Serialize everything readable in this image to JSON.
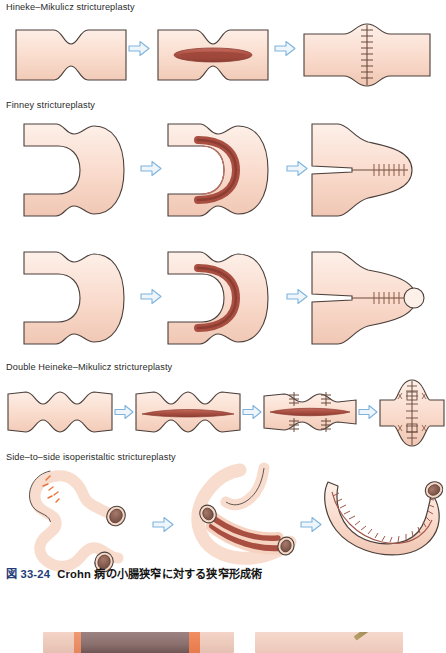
{
  "figure": {
    "number": "図 33-24",
    "caption": "Crohn 病の小腸狭窄に対する狭窄形成術",
    "number_color": "#1f3d7a"
  },
  "sections": [
    {
      "id": "hineke",
      "label": "Hineke–Mikulicz strictureplasty",
      "panel_count": 3
    },
    {
      "id": "finney",
      "label": "Finney strictureplasty",
      "panel_count": 3
    },
    {
      "id": "finney2",
      "label": "",
      "panel_count": 3
    },
    {
      "id": "double-hm",
      "label": "Double Heineke–Mikulicz strictureplasty",
      "panel_count": 4
    },
    {
      "id": "side-to-side",
      "label": "Side–to–side isoperistaltic strictureplasty",
      "panel_count": 3
    }
  ],
  "panels": {
    "hineke": [
      {
        "name": "strictured-bowel-segment",
        "stage": "stricture"
      },
      {
        "name": "longitudinal-enterotomy",
        "stage": "incision"
      },
      {
        "name": "transverse-closure-sutured",
        "stage": "closed"
      }
    ],
    "finney": [
      {
        "name": "folded-bowel-loop",
        "stage": "folded"
      },
      {
        "name": "u-shaped-enterotomy",
        "stage": "incision"
      },
      {
        "name": "side-to-side-anastomosis-sutured",
        "stage": "closed"
      }
    ],
    "finney2": [
      {
        "name": "folded-bowel-loop",
        "stage": "folded"
      },
      {
        "name": "u-shaped-enterotomy",
        "stage": "incision"
      },
      {
        "name": "side-to-side-anastomosis-sutured",
        "stage": "closed"
      }
    ],
    "double-hm": [
      {
        "name": "double-strictured-segment",
        "stage": "stricture"
      },
      {
        "name": "long-longitudinal-enterotomy",
        "stage": "incision"
      },
      {
        "name": "stay-sutures-placed",
        "stage": "sutures"
      },
      {
        "name": "double-transverse-closure",
        "stage": "closed"
      }
    ],
    "side-to-side": [
      {
        "name": "coiled-diseased-bowel",
        "stage": "stricture"
      },
      {
        "name": "apposed-limbs-opened",
        "stage": "incision"
      },
      {
        "name": "completed-isoperistaltic-anastomosis",
        "stage": "closed"
      }
    ]
  },
  "arrows": {
    "glyph": "⇨",
    "count": 11,
    "color": "#6fa8d6",
    "fill": "#eef6fc"
  },
  "colors": {
    "bowel_fill_light": "#fbe3d6",
    "bowel_fill_mid": "#f6d2c0",
    "bowel_outline": "#4a3f3a",
    "mucosa_red": "#b4584c",
    "mucosa_red_dark": "#8f4038",
    "lumen_brown": "#8a5f52",
    "suture": "#6b4a3c",
    "stricture_mark": "#e8743c",
    "background": "#ffffff"
  },
  "bottom_figure": {
    "name": "clipped-photograph-row",
    "visible": "partial top edge of two clinical photographs"
  }
}
